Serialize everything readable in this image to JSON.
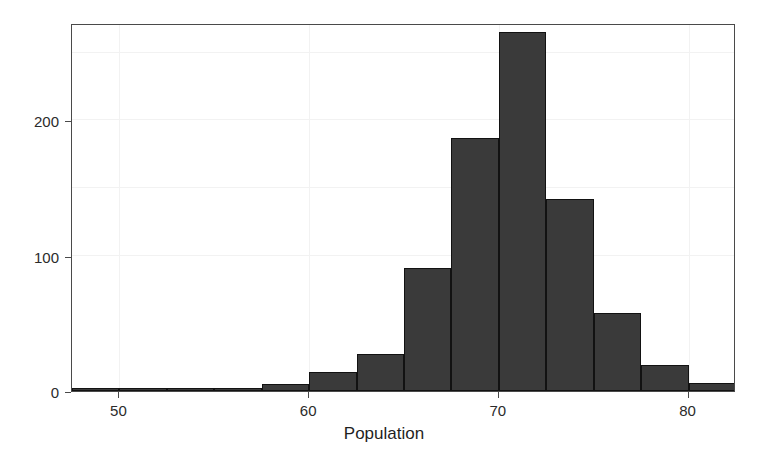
{
  "chart_data": {
    "type": "bar",
    "subtype": "histogram",
    "title": "",
    "xlabel": "Population",
    "ylabel": "",
    "xlim": [
      47.5,
      82.5
    ],
    "ylim": [
      0,
      272
    ],
    "xticks": [
      50,
      60,
      70,
      80
    ],
    "yticks": [
      0,
      100,
      200
    ],
    "xtick_labels": [
      "50",
      "60",
      "70",
      "80"
    ],
    "ytick_labels": [
      "0",
      "100",
      "200"
    ],
    "grid": true,
    "legend": null,
    "bin_width": 2.5,
    "bin_edges": [
      47.5,
      50.0,
      52.5,
      55.0,
      57.5,
      60.0,
      62.5,
      65.0,
      67.5,
      70.0,
      72.5,
      75.0,
      77.5,
      80.0,
      82.5
    ],
    "bin_centers": [
      48.75,
      51.25,
      53.75,
      56.25,
      58.75,
      61.25,
      63.75,
      66.25,
      68.75,
      71.25,
      73.75,
      76.25,
      78.75,
      81.25
    ],
    "values": [
      2,
      0,
      2,
      0,
      5,
      14,
      27,
      91,
      187,
      265,
      142,
      58,
      19,
      6,
      2
    ],
    "bars": [
      {
        "x0": 47.5,
        "x1": 50.0,
        "value": 2
      },
      {
        "x0": 50.0,
        "x1": 52.5,
        "value": 0
      },
      {
        "x0": 52.5,
        "x1": 55.0,
        "value": 2
      },
      {
        "x0": 55.0,
        "x1": 57.5,
        "value": 0
      },
      {
        "x0": 57.5,
        "x1": 60.0,
        "value": 5
      },
      {
        "x0": 60.0,
        "x1": 62.5,
        "value": 14
      },
      {
        "x0": 62.5,
        "x1": 65.0,
        "value": 27
      },
      {
        "x0": 65.0,
        "x1": 67.5,
        "value": 91
      },
      {
        "x0": 67.5,
        "x1": 70.0,
        "value": 187
      },
      {
        "x0": 70.0,
        "x1": 72.5,
        "value": 265
      },
      {
        "x0": 72.5,
        "x1": 75.0,
        "value": 142
      },
      {
        "x0": 75.0,
        "x1": 77.5,
        "value": 58
      },
      {
        "x0": 77.5,
        "x1": 80.0,
        "value": 19
      },
      {
        "x0": 80.0,
        "x1": 82.5,
        "value": 6
      },
      {
        "x0": 82.5,
        "x1": 85.0,
        "value": 2
      }
    ],
    "colors": {
      "bar_fill": "#3a3a3a",
      "bar_edge": "#121212",
      "panel_border": "#4a4a4a",
      "gridline": "#f2f2f2",
      "background": "#ffffff",
      "text": "#2b2b2b"
    }
  }
}
